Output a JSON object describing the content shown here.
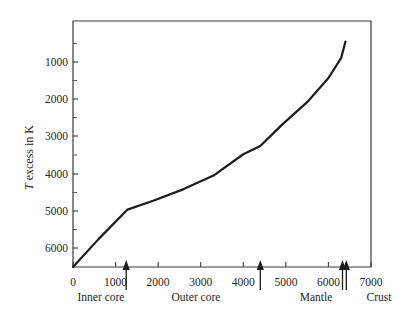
{
  "chart_data": {
    "type": "line",
    "title": "",
    "xlabel": "",
    "ylabel": "T excess in K",
    "xlim": [
      0,
      7000
    ],
    "ylim": [
      6500,
      500
    ],
    "y_inverted": true,
    "grid": false,
    "legend": "none",
    "x_ticks": [
      0,
      1000,
      2000,
      3000,
      4000,
      5000,
      6000,
      7000
    ],
    "x_tick_labels": [
      "0",
      "1000",
      "2000",
      "3000",
      "4000",
      "5000",
      "6000",
      "7000"
    ],
    "y_ticks": [
      1000,
      2000,
      3000,
      4000,
      5000,
      6000
    ],
    "y_tick_labels": [
      "1000",
      "2000",
      "3000",
      "4000",
      "5000",
      "6000"
    ],
    "y_minor_ticks": [
      1500,
      2500,
      3500,
      4500,
      5500,
      6500
    ],
    "series": [
      {
        "name": "T excess",
        "x": [
          0,
          600,
          1280,
          1900,
          2600,
          3300,
          4000,
          4400,
          4900,
          5500,
          6000,
          6300,
          6400
        ],
        "y": [
          6500,
          5820,
          5100,
          4880,
          4600,
          4270,
          3750,
          3550,
          3040,
          2480,
          1890,
          1400,
          1000
        ]
      }
    ],
    "annotations": [
      {
        "name": "inner-core-boundary",
        "x": 1250,
        "label": "Inner core"
      },
      {
        "name": "outer-core-boundary",
        "x": 4400,
        "label": "Outer core"
      },
      {
        "name": "mantle-boundary",
        "x": 6330,
        "label": "Mantle"
      },
      {
        "name": "crust-boundary",
        "x": 6420,
        "label": "Crust"
      }
    ],
    "region_labels": [
      {
        "text": "Inner core",
        "x": 700
      },
      {
        "text": "Outer core",
        "x": 2900
      },
      {
        "text": "Mantle",
        "x": 5700
      },
      {
        "text": "Crust",
        "x": 6800
      }
    ]
  },
  "axes": {
    "y_title_prefix": "T",
    "y_title_rest": " excess in K"
  }
}
